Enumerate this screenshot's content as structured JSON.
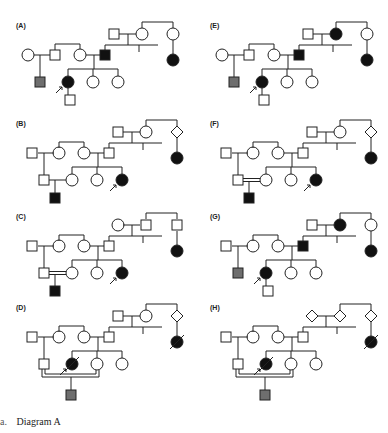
{
  "figure": {
    "panels": [
      {
        "id": "A",
        "label": "(A)",
        "top_couple": {
          "male": "unaffected",
          "female": "unaffected"
        },
        "top_right_relative": {
          "sex": "female",
          "status": "unaffected"
        },
        "top_right_child": {
          "sex": "female",
          "status": "affected"
        },
        "mid_row": [
          {
            "sex": "female",
            "status": "unaffected"
          },
          {
            "sex": "male",
            "status": "unaffected"
          },
          {
            "sex": "female",
            "status": "unaffected"
          },
          {
            "sex": "male",
            "status": "affected"
          }
        ],
        "children_row": [
          {
            "sex": "male",
            "status": "shaded"
          },
          {
            "sex": "female",
            "status": "affected",
            "proband": true
          },
          {
            "sex": "female",
            "status": "unaffected"
          },
          {
            "sex": "female",
            "status": "unaffected"
          }
        ],
        "grandchild": {
          "sex": "male",
          "status": "unaffected"
        },
        "consanguinity": false
      },
      {
        "id": "B",
        "label": "(B)",
        "top_couple": {
          "male": "unaffected",
          "female": "unaffected"
        },
        "top_right_relative": {
          "sex": "unknown",
          "status": "unaffected"
        },
        "top_right_child": {
          "sex": "female",
          "status": "affected"
        },
        "mid_row": [
          {
            "sex": "male",
            "status": "unaffected"
          },
          {
            "sex": "female",
            "status": "unaffected"
          },
          {
            "sex": "female",
            "status": "unaffected"
          },
          {
            "sex": "male",
            "status": "unaffected"
          }
        ],
        "children_row": [
          {
            "sex": "male",
            "status": "unaffected"
          },
          {
            "sex": "female",
            "status": "unaffected"
          },
          {
            "sex": "female",
            "status": "unaffected"
          },
          {
            "sex": "female",
            "status": "affected",
            "proband": true
          }
        ],
        "grandchild": {
          "sex": "male",
          "status": "affected"
        },
        "consanguinity": false
      },
      {
        "id": "C",
        "label": "(C)",
        "top_couple": {
          "male": "unaffected",
          "female": "unaffected"
        },
        "top_right_relative": {
          "sex": "male",
          "status": "unaffected"
        },
        "top_right_child": {
          "sex": "female",
          "status": "affected"
        },
        "mid_row": [
          {
            "sex": "male",
            "status": "unaffected"
          },
          {
            "sex": "female",
            "status": "unaffected"
          },
          {
            "sex": "female",
            "status": "unaffected"
          },
          {
            "sex": "male",
            "status": "unaffected"
          }
        ],
        "children_row": [
          {
            "sex": "male",
            "status": "unaffected"
          },
          {
            "sex": "female",
            "status": "unaffected"
          },
          {
            "sex": "female",
            "status": "unaffected"
          },
          {
            "sex": "female",
            "status": "affected",
            "proband": true
          }
        ],
        "grandchild": {
          "sex": "male",
          "status": "affected"
        },
        "consanguinity": true
      },
      {
        "id": "D",
        "label": "(D)",
        "top_couple": {
          "male": "unaffected",
          "female": "unaffected"
        },
        "top_right_relative": {
          "sex": "unknown",
          "status": "unaffected"
        },
        "top_right_child": {
          "sex": "female",
          "status": "deceased-affected"
        },
        "mid_row": [
          {
            "sex": "male",
            "status": "unaffected"
          },
          {
            "sex": "female",
            "status": "unaffected"
          },
          {
            "sex": "female",
            "status": "unaffected"
          },
          {
            "sex": "male",
            "status": "unaffected"
          }
        ],
        "children_row": [
          {
            "sex": "male",
            "status": "unaffected"
          },
          {
            "sex": "female",
            "status": "deceased-affected",
            "proband": true
          },
          {
            "sex": "female",
            "status": "unaffected"
          },
          {
            "sex": "female",
            "status": "unaffected"
          }
        ],
        "grandchild": {
          "sex": "male",
          "status": "shaded"
        },
        "consanguinity": true
      },
      {
        "id": "E",
        "label": "(E)",
        "top_couple": {
          "male": "unaffected",
          "female": "affected"
        },
        "top_right_relative": {
          "sex": "female",
          "status": "unaffected"
        },
        "top_right_child": {
          "sex": "female",
          "status": "affected"
        },
        "mid_row": [
          {
            "sex": "female",
            "status": "unaffected"
          },
          {
            "sex": "male",
            "status": "unaffected"
          },
          {
            "sex": "female",
            "status": "unaffected"
          },
          {
            "sex": "male",
            "status": "affected"
          }
        ],
        "children_row": [
          {
            "sex": "male",
            "status": "shaded"
          },
          {
            "sex": "female",
            "status": "affected",
            "proband": true
          },
          {
            "sex": "female",
            "status": "unaffected"
          },
          {
            "sex": "female",
            "status": "unaffected"
          }
        ],
        "grandchild": {
          "sex": "male",
          "status": "unaffected"
        },
        "consanguinity": false
      },
      {
        "id": "F",
        "label": "(F)",
        "top_couple": {
          "male": "unaffected",
          "female": "unaffected"
        },
        "top_right_relative": {
          "sex": "unknown",
          "status": "unaffected"
        },
        "top_right_child": {
          "sex": "female",
          "status": "affected"
        },
        "mid_row": [
          {
            "sex": "male",
            "status": "unaffected"
          },
          {
            "sex": "female",
            "status": "unaffected"
          },
          {
            "sex": "female",
            "status": "unaffected"
          },
          {
            "sex": "male",
            "status": "unaffected"
          }
        ],
        "children_row": [
          {
            "sex": "male",
            "status": "unaffected"
          },
          {
            "sex": "female",
            "status": "unaffected"
          },
          {
            "sex": "female",
            "status": "unaffected"
          },
          {
            "sex": "female",
            "status": "affected",
            "proband": true
          }
        ],
        "grandchild": {
          "sex": "male",
          "status": "affected"
        },
        "consanguinity": true
      },
      {
        "id": "G",
        "label": "(G)",
        "top_couple": {
          "male": "unaffected",
          "female": "affected"
        },
        "top_right_relative": {
          "sex": "female",
          "status": "unaffected"
        },
        "top_right_child": {
          "sex": "female",
          "status": "affected"
        },
        "mid_row": [
          {
            "sex": "male",
            "status": "unaffected"
          },
          {
            "sex": "female",
            "status": "unaffected"
          },
          {
            "sex": "female",
            "status": "unaffected"
          },
          {
            "sex": "male",
            "status": "affected"
          }
        ],
        "children_row": [
          {
            "sex": "male",
            "status": "shaded"
          },
          {
            "sex": "female",
            "status": "affected",
            "proband": true
          },
          {
            "sex": "female",
            "status": "unaffected"
          },
          {
            "sex": "female",
            "status": "unaffected"
          }
        ],
        "grandchild": {
          "sex": "male",
          "status": "unaffected"
        },
        "consanguinity": false
      },
      {
        "id": "H",
        "label": "(H)",
        "top_couple": {
          "male": "unknown-unaffected",
          "female": "unknown-unaffected"
        },
        "top_right_relative": {
          "sex": "unknown",
          "status": "unaffected"
        },
        "top_right_child": {
          "sex": "female",
          "status": "deceased-affected"
        },
        "mid_row": [
          {
            "sex": "male",
            "status": "unaffected"
          },
          {
            "sex": "female",
            "status": "unaffected"
          },
          {
            "sex": "female",
            "status": "unaffected"
          },
          {
            "sex": "male",
            "status": "unaffected"
          }
        ],
        "children_row": [
          {
            "sex": "male",
            "status": "unaffected"
          },
          {
            "sex": "female",
            "status": "deceased-affected",
            "proband": true
          },
          {
            "sex": "female",
            "status": "unaffected"
          },
          {
            "sex": "female",
            "status": "unaffected"
          }
        ],
        "grandchild": {
          "sex": "male",
          "status": "shaded"
        },
        "consanguinity": true
      }
    ],
    "colors": {
      "line": "#222222",
      "affected": "#111111",
      "shaded": "#6e6e6e",
      "unaffected": "#ffffff"
    }
  },
  "caption": {
    "letter": "a.",
    "text": "Diagram A"
  }
}
